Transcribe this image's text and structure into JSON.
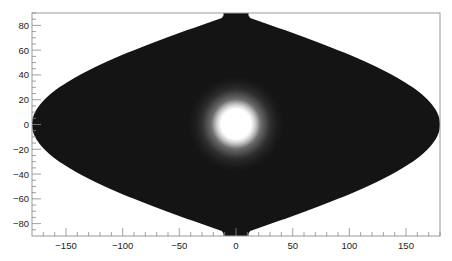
{
  "chart_data": {
    "type": "heatmap",
    "projection": "sinusoidal",
    "title": "",
    "xlabel": "",
    "ylabel": "",
    "xlim": [
      -180,
      180
    ],
    "ylim": [
      -90,
      90
    ],
    "x_ticks": [
      -150,
      -100,
      -50,
      0,
      50,
      100,
      150
    ],
    "y_ticks": [
      -80,
      -60,
      -40,
      -20,
      0,
      20,
      40,
      60,
      80
    ],
    "grid": false,
    "legend": null,
    "background_value": "low (near black)",
    "hotspot": {
      "x": 0,
      "y": 0,
      "core_radius_deg": 12,
      "halo_radius_deg": 30,
      "peak": "saturated white"
    },
    "colors": {
      "background": "#111111",
      "peak": "#ffffff",
      "frame": "#999999"
    }
  },
  "axis": {
    "x_labels": [
      "−150",
      "−100",
      "−50",
      "0",
      "50",
      "100",
      "150"
    ],
    "y_labels": [
      "80",
      "60",
      "40",
      "20",
      "0",
      "−20",
      "−40",
      "−60",
      "−80"
    ]
  }
}
